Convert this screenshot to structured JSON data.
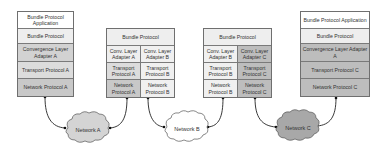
{
  "diagram": {
    "type": "protocol-stack-network-diagram",
    "nodes": [
      {
        "id": "source",
        "layers": [
          {
            "label": "Bundle Protocol Application"
          },
          {
            "label": "Bundle Protocol"
          },
          {
            "label": "Convergence Layer Adapter A"
          },
          {
            "label": "Transport Protocol A"
          },
          {
            "label": "Network Protocol A"
          }
        ]
      },
      {
        "id": "forwarder-1",
        "top": "Bundle Protocol",
        "left": [
          "Conv. Layer Adapter A",
          "Transport Protocol A",
          "Network Protocol A"
        ],
        "right": [
          "Conv. Layer Adapter B",
          "Transport Protocol B",
          "Network Protocol B"
        ]
      },
      {
        "id": "forwarder-2",
        "top": "Bundle Protocol",
        "left": [
          "Conv. Layer Adapter B",
          "Transport Protocol B",
          "Network Protocol B"
        ],
        "right": [
          "Conv. Layer Adapter C",
          "Transport Protocol C",
          "Network Protocol C"
        ]
      },
      {
        "id": "destination",
        "layers": [
          {
            "label": "Bundle Protocol Application"
          },
          {
            "label": "Bundle Protocol"
          },
          {
            "label": "Convergence Layer Adapter A"
          },
          {
            "label": "Transport Protocol C"
          },
          {
            "label": "Network Protocol C"
          }
        ]
      }
    ],
    "networks": [
      {
        "label": "Network A",
        "color": "#d4d4d4"
      },
      {
        "label": "Network B",
        "color": "#ffffff"
      },
      {
        "label": "Network C",
        "color": "#a8a8a8"
      }
    ],
    "edges": [
      {
        "from": "Network Protocol A (source)",
        "to": "Network A"
      },
      {
        "from": "Network A",
        "to": "Network Protocol A (forwarder-1)"
      },
      {
        "from": "Network Protocol B (forwarder-1)",
        "to": "Network B"
      },
      {
        "from": "Network B",
        "to": "Network Protocol B (forwarder-2)"
      },
      {
        "from": "Network Protocol C (forwarder-2)",
        "to": "Network C"
      },
      {
        "from": "Network C",
        "to": "Network Protocol C (destination)"
      }
    ]
  }
}
